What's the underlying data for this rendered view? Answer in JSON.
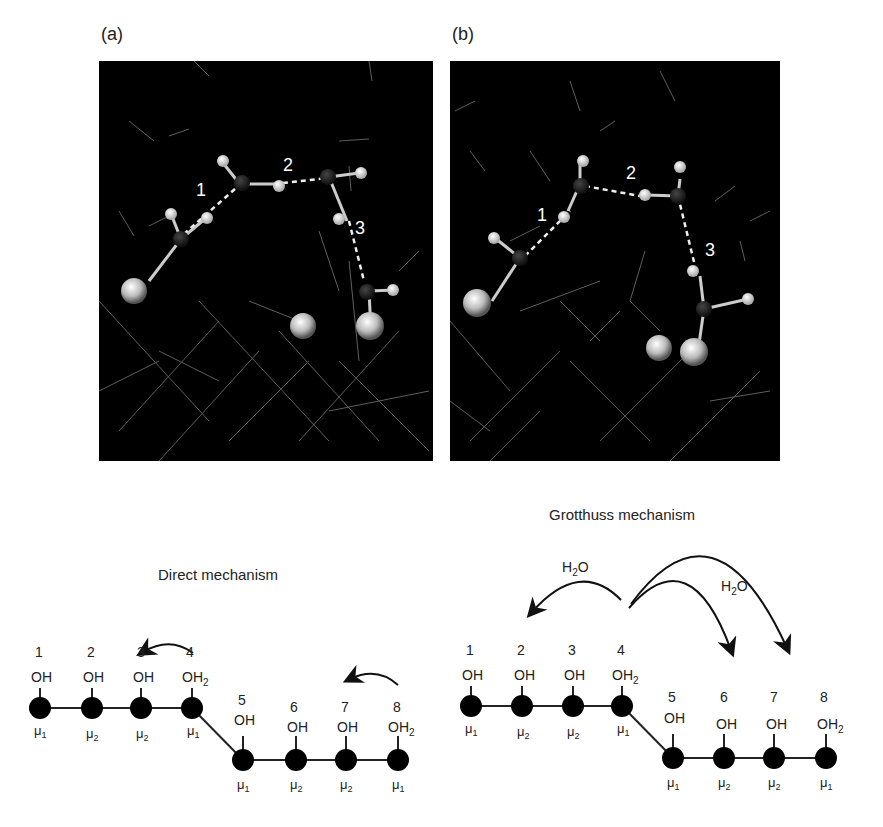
{
  "panels": {
    "a": {
      "label": "(a)",
      "bond_labels": [
        "1",
        "2",
        "3"
      ]
    },
    "b": {
      "label": "(b)",
      "bond_labels": [
        "1",
        "2",
        "3"
      ]
    }
  },
  "direct": {
    "title": "Direct mechanism",
    "sites": [
      {
        "num": "1",
        "group": "OH",
        "sub": "",
        "mu": "μ",
        "mu_sub": "1"
      },
      {
        "num": "2",
        "group": "OH",
        "sub": "",
        "mu": "μ",
        "mu_sub": "2"
      },
      {
        "num": "3",
        "group": "OH",
        "sub": "",
        "mu": "μ",
        "mu_sub": "2"
      },
      {
        "num": "4",
        "group": "OH",
        "sub": "2",
        "mu": "μ",
        "mu_sub": "1"
      },
      {
        "num": "5",
        "group": "OH",
        "sub": "",
        "mu": "μ",
        "mu_sub": "1"
      },
      {
        "num": "6",
        "group": "OH",
        "sub": "",
        "mu": "μ",
        "mu_sub": "2"
      },
      {
        "num": "7",
        "group": "OH",
        "sub": "",
        "mu": "μ",
        "mu_sub": "2"
      },
      {
        "num": "8",
        "group": "OH",
        "sub": "2",
        "mu": "μ",
        "mu_sub": "1"
      }
    ]
  },
  "grotthuss": {
    "title": "Grotthuss mechanism",
    "arrow_labels": [
      {
        "text": "H",
        "sub": "2",
        "tail": "O"
      },
      {
        "text": "H",
        "sub": "2",
        "tail": "O"
      }
    ],
    "sites": [
      {
        "num": "1",
        "group": "OH",
        "sub": "",
        "mu": "μ",
        "mu_sub": "1"
      },
      {
        "num": "2",
        "group": "OH",
        "sub": "",
        "mu": "μ",
        "mu_sub": "2"
      },
      {
        "num": "3",
        "group": "OH",
        "sub": "",
        "mu": "μ",
        "mu_sub": "2"
      },
      {
        "num": "4",
        "group": "OH",
        "sub": "2",
        "mu": "μ",
        "mu_sub": "1"
      },
      {
        "num": "5",
        "group": "OH",
        "sub": "",
        "mu": "μ",
        "mu_sub": "1"
      },
      {
        "num": "6",
        "group": "OH",
        "sub": "",
        "mu": "μ",
        "mu_sub": "2"
      },
      {
        "num": "7",
        "group": "OH",
        "sub": "",
        "mu": "μ",
        "mu_sub": "2"
      },
      {
        "num": "8",
        "group": "OH",
        "sub": "2",
        "mu": "μ",
        "mu_sub": "1"
      }
    ]
  },
  "colors": {
    "background": "#ffffff",
    "sim_bg": "#000000",
    "ink": "#111111"
  }
}
